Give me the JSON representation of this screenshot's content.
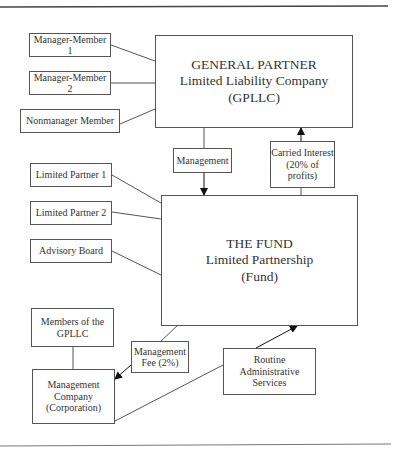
{
  "diagram": {
    "general_partner": {
      "lines": [
        "GENERAL PARTNER",
        "Limited Liability Company",
        "(GPLLC)"
      ]
    },
    "gp_members": [
      {
        "label": "Manager-Member 1"
      },
      {
        "label": "Manager-Member 2"
      },
      {
        "label": "Nonmanager Member"
      }
    ],
    "management": {
      "label": "Management"
    },
    "carried_interest": {
      "lines": [
        "Carried Interest",
        "(20% of",
        "profits)"
      ]
    },
    "fund": {
      "lines": [
        "THE FUND",
        "Limited Partnership",
        "(Fund)"
      ]
    },
    "fund_members": [
      {
        "label": "Limited Partner 1"
      },
      {
        "label": "Limited Partner 2"
      },
      {
        "label": "Advisory Board"
      }
    ],
    "members_of_gpllc": {
      "lines": [
        "Members of the",
        "GPLLC"
      ]
    },
    "management_fee": {
      "lines": [
        "Management",
        "Fee (2%)"
      ]
    },
    "management_company": {
      "lines": [
        "Management",
        "Company",
        "(Corporation)"
      ]
    },
    "routine_services": {
      "lines": [
        "Routine",
        "Administrative Services"
      ]
    }
  }
}
